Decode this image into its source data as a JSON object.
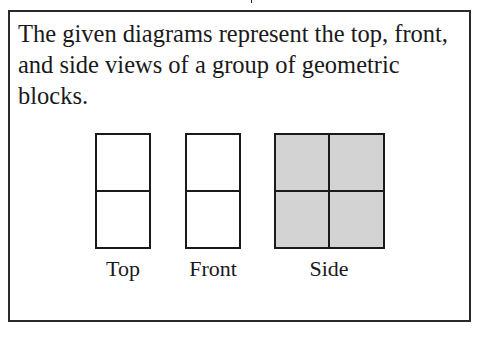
{
  "question": {
    "text": "The given diagrams represent the top, front, and side views of a group of geometric blocks."
  },
  "views": [
    {
      "label": "Top",
      "grid": "1 column × 2 rows",
      "fill": "#ffffff"
    },
    {
      "label": "Front",
      "grid": "1 column × 2 rows",
      "fill": "#ffffff"
    },
    {
      "label": "Side",
      "grid": "2 columns × 2 rows",
      "fill": "#d3d3d3"
    }
  ]
}
